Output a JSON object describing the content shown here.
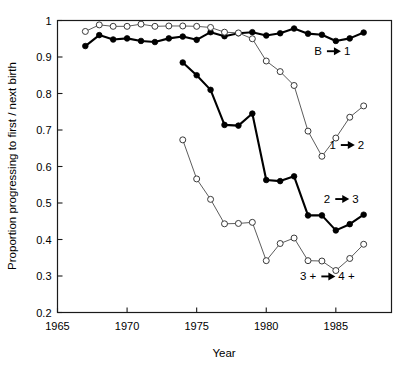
{
  "chart_data": {
    "type": "line",
    "title": "",
    "xlabel": "Year",
    "ylabel": "Proportion progressing to first / next birth",
    "xlim": [
      1965,
      1989
    ],
    "ylim": [
      0.2,
      1.0
    ],
    "xticks": [
      1965,
      1970,
      1975,
      1980,
      1985
    ],
    "yticks": [
      0.2,
      0.3,
      0.4,
      0.5,
      0.6,
      0.7,
      0.8,
      0.9,
      1
    ],
    "ytick_labels": [
      "0.2",
      "0.3",
      "0.4",
      "0.5",
      "0.6",
      "0.7",
      "0.8",
      "0.9",
      "1"
    ],
    "xtick_labels": [
      "1965",
      "1970",
      "1975",
      "1980",
      "1985"
    ],
    "grid": false,
    "legend_position": "inline-annotations",
    "series": [
      {
        "name": "B to 1 (filled)",
        "label": "B",
        "label_to": "1",
        "marker": "filled-circle",
        "x": [
          1967,
          1968,
          1969,
          1970,
          1971,
          1972,
          1973,
          1974,
          1975,
          1976,
          1977,
          1978,
          1979,
          1980,
          1981,
          1982,
          1983,
          1984,
          1985,
          1986,
          1987
        ],
        "values": [
          0.93,
          0.96,
          0.948,
          0.951,
          0.944,
          0.941,
          0.951,
          0.956,
          0.947,
          0.968,
          0.957,
          0.965,
          0.968,
          0.959,
          0.965,
          0.978,
          0.964,
          0.961,
          0.944,
          0.951,
          0.967
        ]
      },
      {
        "name": "B to 1 (open)",
        "label": "B",
        "label_to": "1",
        "marker": "open-circle",
        "x": [
          1967,
          1968,
          1969,
          1970,
          1971,
          1972,
          1973,
          1974,
          1975,
          1976,
          1977,
          1978,
          1979,
          1980,
          1981,
          1982,
          1983,
          1984,
          1985,
          1986,
          1987
        ],
        "values": [
          0.97,
          0.988,
          0.984,
          0.984,
          0.99,
          0.984,
          0.985,
          0.985,
          0.984,
          0.981,
          0.968,
          0.966,
          0.95,
          0.889,
          0.86,
          0.822,
          0.697,
          0.628,
          0.678,
          0.735,
          0.766
        ]
      },
      {
        "name": "1 to 2 (filled)",
        "label": "1",
        "label_to": "2",
        "marker": "filled-circle",
        "x": [
          1974,
          1975,
          1976,
          1977,
          1978,
          1979,
          1980,
          1981,
          1982,
          1983,
          1984,
          1985,
          1986,
          1987
        ],
        "values": [
          0.885,
          0.85,
          0.81,
          0.714,
          0.712,
          0.745,
          0.563,
          0.56,
          0.573,
          0.466,
          0.466,
          0.425,
          0.442,
          0.468
        ]
      },
      {
        "name": "2 to 3 (open)",
        "label": "2",
        "label_to": "3",
        "marker": "open-circle",
        "x": [
          1974,
          1975,
          1976,
          1977,
          1978,
          1979,
          1980,
          1981,
          1982,
          1983,
          1984,
          1985,
          1986,
          1987
        ],
        "values": [
          0.673,
          0.566,
          0.51,
          0.443,
          0.444,
          0.447,
          0.342,
          0.389,
          0.404,
          0.342,
          0.341,
          0.315,
          0.348,
          0.387
        ]
      }
    ],
    "annotations": [
      {
        "id": "b-to-1",
        "text_left": "B",
        "text_right": "1",
        "x": 1984.0,
        "y": 0.905
      },
      {
        "id": "1-to-2",
        "text_left": "1",
        "text_right": "2",
        "x": 1985.0,
        "y": 0.648
      },
      {
        "id": "2-to-3",
        "text_left": "2",
        "text_right": "3",
        "x": 1984.6,
        "y": 0.5
      },
      {
        "id": "3plus-to-4plus",
        "text_left": "3 +",
        "text_right": "4 +",
        "x": 1983.6,
        "y": 0.288
      }
    ],
    "colors": {
      "line_filled": "#000000",
      "line_open": "#4a4a4a",
      "marker_open_fill": "#ffffff",
      "axis": "#1a1a1a",
      "background": "#ffffff"
    }
  }
}
